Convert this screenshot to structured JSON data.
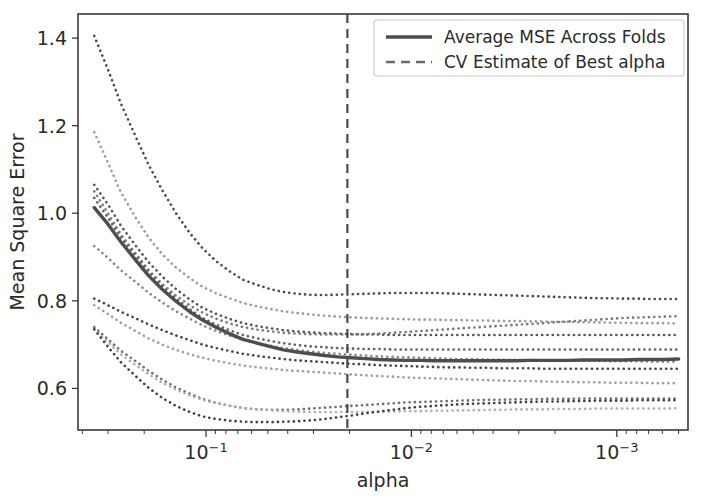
{
  "chart_data": {
    "type": "line",
    "title": "",
    "xlabel": "alpha",
    "ylabel": "Mean Square Error",
    "x_scale": "log",
    "x_inverted": true,
    "xlim": [
      0.00045,
      0.42
    ],
    "ylim": [
      0.505,
      1.455
    ],
    "grid": false,
    "legend_position": "upper right",
    "x_major_ticks": [
      {
        "value": 0.1,
        "label_base": "10",
        "label_exp": "−1"
      },
      {
        "value": 0.01,
        "label_base": "10",
        "label_exp": "−2"
      },
      {
        "value": 0.001,
        "label_base": "10",
        "label_exp": "−3"
      }
    ],
    "y_ticks": [
      0.6,
      0.8,
      1.0,
      1.2,
      1.4
    ],
    "y_tick_labels": [
      "0.6",
      "0.8",
      "1.0",
      "1.2",
      "1.4"
    ],
    "legend": [
      {
        "label": "Average MSE Across Folds",
        "style": "solid",
        "color": "#4d4d4d"
      },
      {
        "label": "CV Estimate of Best alpha",
        "style": "dashed",
        "color": "#6a6a6a"
      }
    ],
    "annotations": [
      {
        "name": "cv-best-alpha",
        "type": "vline",
        "x": 0.0205,
        "style": "dashed",
        "color": "#4a4a4a"
      }
    ],
    "x": [
      0.35,
      0.3,
      0.26,
      0.22,
      0.19,
      0.163,
      0.14,
      0.12,
      0.104,
      0.089,
      0.076,
      0.066,
      0.056,
      0.048,
      0.042,
      0.036,
      0.031,
      0.0265,
      0.0228,
      0.0196,
      0.0168,
      0.0144,
      0.0124,
      0.0106,
      0.0091,
      0.0078,
      0.0067,
      0.0058,
      0.005,
      0.0043,
      0.0037,
      0.0031,
      0.0027,
      0.0023,
      0.002,
      0.0017,
      0.00146,
      0.00125,
      0.00108,
      0.00092,
      0.00079,
      0.00068,
      0.00058,
      0.0005
    ],
    "series": [
      {
        "name": "Average MSE Across Folds",
        "kind": "average",
        "color": "#4d4d4d",
        "values": [
          1.013,
          0.975,
          0.935,
          0.893,
          0.857,
          0.826,
          0.799,
          0.775,
          0.756,
          0.739,
          0.724,
          0.712,
          0.703,
          0.695,
          0.688,
          0.683,
          0.679,
          0.675,
          0.672,
          0.67,
          0.668,
          0.666,
          0.665,
          0.664,
          0.664,
          0.663,
          0.663,
          0.663,
          0.663,
          0.663,
          0.663,
          0.663,
          0.664,
          0.664,
          0.664,
          0.664,
          0.665,
          0.665,
          0.665,
          0.665,
          0.666,
          0.666,
          0.666,
          0.667
        ]
      },
      {
        "name": "fold-1",
        "kind": "fold",
        "color": "#4a4a4a",
        "values": [
          1.405,
          1.328,
          1.251,
          1.175,
          1.11,
          1.052,
          1.0,
          0.955,
          0.92,
          0.89,
          0.866,
          0.848,
          0.836,
          0.826,
          0.82,
          0.816,
          0.814,
          0.813,
          0.814,
          0.815,
          0.816,
          0.817,
          0.818,
          0.818,
          0.818,
          0.818,
          0.817,
          0.816,
          0.815,
          0.814,
          0.813,
          0.812,
          0.811,
          0.81,
          0.809,
          0.808,
          0.807,
          0.806,
          0.806,
          0.805,
          0.805,
          0.804,
          0.804,
          0.804
        ]
      },
      {
        "name": "fold-2",
        "kind": "fold",
        "color": "#9a9a9a",
        "values": [
          1.185,
          1.115,
          1.048,
          0.99,
          0.944,
          0.906,
          0.876,
          0.852,
          0.832,
          0.817,
          0.805,
          0.795,
          0.787,
          0.781,
          0.776,
          0.772,
          0.769,
          0.766,
          0.764,
          0.762,
          0.761,
          0.76,
          0.759,
          0.758,
          0.757,
          0.757,
          0.756,
          0.756,
          0.755,
          0.755,
          0.754,
          0.754,
          0.753,
          0.753,
          0.752,
          0.752,
          0.751,
          0.751,
          0.75,
          0.75,
          0.749,
          0.749,
          0.749,
          0.748
        ]
      },
      {
        "name": "fold-3",
        "kind": "fold",
        "color": "#555555",
        "values": [
          1.065,
          1.02,
          0.972,
          0.926,
          0.888,
          0.855,
          0.827,
          0.803,
          0.784,
          0.77,
          0.758,
          0.749,
          0.742,
          0.737,
          0.733,
          0.73,
          0.728,
          0.726,
          0.725,
          0.724,
          0.723,
          0.723,
          0.722,
          0.722,
          0.722,
          0.722,
          0.722,
          0.722,
          0.722,
          0.722,
          0.722,
          0.722,
          0.722,
          0.722,
          0.722,
          0.722,
          0.722,
          0.722,
          0.722,
          0.722,
          0.722,
          0.722,
          0.722,
          0.722
        ]
      },
      {
        "name": "fold-4",
        "kind": "fold",
        "color": "#7a7a7a",
        "values": [
          1.05,
          1.0,
          0.952,
          0.908,
          0.87,
          0.838,
          0.812,
          0.79,
          0.773,
          0.759,
          0.748,
          0.74,
          0.734,
          0.73,
          0.727,
          0.725,
          0.724,
          0.723,
          0.723,
          0.723,
          0.724,
          0.725,
          0.727,
          0.729,
          0.731,
          0.733,
          0.735,
          0.737,
          0.739,
          0.741,
          0.743,
          0.745,
          0.747,
          0.749,
          0.751,
          0.753,
          0.755,
          0.757,
          0.759,
          0.761,
          0.762,
          0.763,
          0.764,
          0.765
        ]
      },
      {
        "name": "fold-5",
        "kind": "fold",
        "color": "#606060",
        "values": [
          1.035,
          0.99,
          0.945,
          0.903,
          0.866,
          0.833,
          0.805,
          0.781,
          0.761,
          0.745,
          0.732,
          0.722,
          0.714,
          0.708,
          0.703,
          0.699,
          0.696,
          0.694,
          0.692,
          0.691,
          0.69,
          0.69,
          0.689,
          0.689,
          0.689,
          0.689,
          0.689,
          0.689,
          0.689,
          0.689,
          0.689,
          0.689,
          0.689,
          0.689,
          0.689,
          0.689,
          0.689,
          0.689,
          0.689,
          0.689,
          0.689,
          0.689,
          0.689,
          0.689
        ]
      },
      {
        "name": "fold-6",
        "kind": "fold",
        "color": "#888888",
        "values": [
          0.925,
          0.898,
          0.87,
          0.843,
          0.818,
          0.796,
          0.776,
          0.759,
          0.744,
          0.731,
          0.72,
          0.711,
          0.703,
          0.697,
          0.692,
          0.688,
          0.684,
          0.681,
          0.679,
          0.677,
          0.675,
          0.673,
          0.672,
          0.671,
          0.67,
          0.669,
          0.668,
          0.667,
          0.667,
          0.666,
          0.666,
          0.665,
          0.665,
          0.664,
          0.664,
          0.663,
          0.663,
          0.663,
          0.662,
          0.662,
          0.662,
          0.661,
          0.661,
          0.661
        ]
      },
      {
        "name": "fold-7",
        "kind": "fold",
        "color": "#444444",
        "values": [
          0.805,
          0.79,
          0.775,
          0.76,
          0.746,
          0.733,
          0.721,
          0.71,
          0.7,
          0.692,
          0.685,
          0.679,
          0.674,
          0.67,
          0.667,
          0.664,
          0.662,
          0.66,
          0.658,
          0.656,
          0.655,
          0.653,
          0.652,
          0.651,
          0.65,
          0.649,
          0.648,
          0.648,
          0.647,
          0.647,
          0.646,
          0.646,
          0.646,
          0.645,
          0.645,
          0.645,
          0.645,
          0.645,
          0.645,
          0.645,
          0.645,
          0.645,
          0.645,
          0.645
        ]
      },
      {
        "name": "fold-8",
        "kind": "fold",
        "color": "#9f9f9f",
        "values": [
          0.79,
          0.77,
          0.75,
          0.731,
          0.714,
          0.7,
          0.688,
          0.678,
          0.67,
          0.663,
          0.657,
          0.652,
          0.648,
          0.645,
          0.642,
          0.64,
          0.638,
          0.636,
          0.634,
          0.632,
          0.63,
          0.628,
          0.627,
          0.625,
          0.624,
          0.623,
          0.622,
          0.621,
          0.62,
          0.619,
          0.618,
          0.617,
          0.617,
          0.616,
          0.615,
          0.615,
          0.614,
          0.614,
          0.613,
          0.613,
          0.613,
          0.612,
          0.612,
          0.612
        ]
      },
      {
        "name": "fold-9",
        "kind": "fold",
        "color": "#6f6f6f",
        "values": [
          0.74,
          0.712,
          0.686,
          0.662,
          0.64,
          0.62,
          0.602,
          0.588,
          0.576,
          0.567,
          0.56,
          0.555,
          0.552,
          0.551,
          0.551,
          0.552,
          0.554,
          0.556,
          0.558,
          0.56,
          0.562,
          0.564,
          0.566,
          0.568,
          0.569,
          0.57,
          0.571,
          0.572,
          0.573,
          0.574,
          0.574,
          0.575,
          0.575,
          0.576,
          0.576,
          0.576,
          0.577,
          0.577,
          0.577,
          0.577,
          0.577,
          0.577,
          0.577,
          0.577
        ]
      },
      {
        "name": "fold-10",
        "kind": "fold",
        "color": "#aeaeae",
        "values": [
          0.735,
          0.705,
          0.678,
          0.653,
          0.632,
          0.613,
          0.597,
          0.584,
          0.574,
          0.566,
          0.56,
          0.555,
          0.552,
          0.55,
          0.548,
          0.547,
          0.546,
          0.546,
          0.546,
          0.546,
          0.546,
          0.547,
          0.547,
          0.548,
          0.548,
          0.549,
          0.549,
          0.55,
          0.55,
          0.551,
          0.551,
          0.552,
          0.552,
          0.552,
          0.553,
          0.553,
          0.553,
          0.554,
          0.554,
          0.554,
          0.554,
          0.554,
          0.554,
          0.555
        ]
      },
      {
        "name": "fold-11",
        "kind": "fold",
        "color": "#3f3f3f",
        "values": [
          0.735,
          0.695,
          0.66,
          0.628,
          0.601,
          0.578,
          0.56,
          0.546,
          0.536,
          0.53,
          0.526,
          0.524,
          0.523,
          0.523,
          0.524,
          0.525,
          0.527,
          0.53,
          0.534,
          0.538,
          0.543,
          0.547,
          0.551,
          0.555,
          0.558,
          0.56,
          0.562,
          0.564,
          0.565,
          0.566,
          0.567,
          0.568,
          0.569,
          0.57,
          0.57,
          0.571,
          0.571,
          0.572,
          0.572,
          0.572,
          0.573,
          0.573,
          0.573,
          0.573
        ]
      }
    ]
  },
  "figure": {
    "plot_area": {
      "left": 78,
      "top": 14,
      "right": 688,
      "bottom": 430
    },
    "background": "#ffffff",
    "spine_color": "#3a3a3a"
  }
}
